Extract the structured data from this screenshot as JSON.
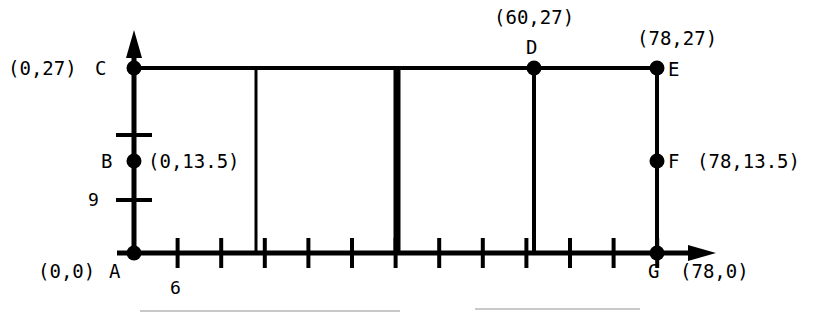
{
  "figure": {
    "axis_color": "#000000",
    "background": "#ffffff",
    "line_color": "#000000"
  },
  "axes": {
    "x_axis": {
      "name": "x-axis",
      "origin_units": 0,
      "end_units": 78,
      "tick_count": 12,
      "tick_step_units": 6.5,
      "labeled_ticks": [
        {
          "label": "6",
          "units": 6.5
        }
      ],
      "has_arrow": true
    },
    "y_axis": {
      "name": "y-axis",
      "origin_units": 0,
      "end_units": 27,
      "tick_count": 2,
      "labeled_ticks": [
        {
          "label": "9",
          "units": 9
        }
      ],
      "has_arrow": true
    }
  },
  "points": [
    {
      "id": "A",
      "letter": "A",
      "coord_label": "(0,0)",
      "x_units": 0,
      "y_units": 0,
      "dot": true,
      "letter_side": "right",
      "coord_side": "left"
    },
    {
      "id": "B",
      "letter": "B",
      "coord_label": "(0,13.5)",
      "x_units": 0,
      "y_units": 13.5,
      "dot": true,
      "letter_side": "left",
      "coord_side": "right"
    },
    {
      "id": "C",
      "letter": "C",
      "coord_label": "(0,27)",
      "x_units": 0,
      "y_units": 27,
      "dot": true,
      "letter_side": "left",
      "coord_side": "left"
    },
    {
      "id": "D",
      "letter": "D",
      "coord_label": "(60,27)",
      "x_units": 60,
      "y_units": 27,
      "dot": true,
      "letter_side": "above",
      "coord_side": "above"
    },
    {
      "id": "E",
      "letter": "E",
      "coord_label": "(78,27)",
      "x_units": 78,
      "y_units": 27,
      "dot": true,
      "letter_side": "right",
      "coord_side": "above"
    },
    {
      "id": "F",
      "letter": "F",
      "coord_label": "(78,13.5)",
      "x_units": 78,
      "y_units": 13.5,
      "dot": true,
      "letter_side": "right",
      "coord_side": "right"
    },
    {
      "id": "G",
      "letter": "G",
      "coord_label": "(78,0)",
      "x_units": 78,
      "y_units": 0,
      "dot": true,
      "letter_side": "below",
      "coord_side": "below"
    }
  ],
  "labels": {
    "A_coord": "(0,0)",
    "A_letter": "A",
    "B_letter": "B",
    "B_coord": "(0,13.5)",
    "C_coord": "(0,27)",
    "C_letter": "C",
    "D_coord": "(60,27)",
    "D_letter": "D",
    "E_coord": "(78,27)",
    "E_letter": "E",
    "F_letter": "F",
    "F_coord": "(78,13.5)",
    "G_letter": "G",
    "G_coord": "(78,0)",
    "x_tick_6": "6",
    "y_tick_9": "9"
  },
  "segments": [
    {
      "name": "top-edge-C-to-E",
      "from": "C",
      "to": "E",
      "weight": "normal"
    },
    {
      "name": "right-edge-E-to-G",
      "from": "E",
      "to": "G",
      "weight": "normal"
    },
    {
      "name": "vertical-divider-thin",
      "x_units": 19.5,
      "from_y": 0,
      "to_y": 27,
      "weight": "normal"
    },
    {
      "name": "vertical-divider-thick",
      "x_units": 39,
      "from_y": 0,
      "to_y": 27,
      "weight": "bold"
    },
    {
      "name": "vertical-at-D",
      "x_units": 60,
      "from_y": 0,
      "to_y": 27,
      "weight": "normal"
    }
  ]
}
